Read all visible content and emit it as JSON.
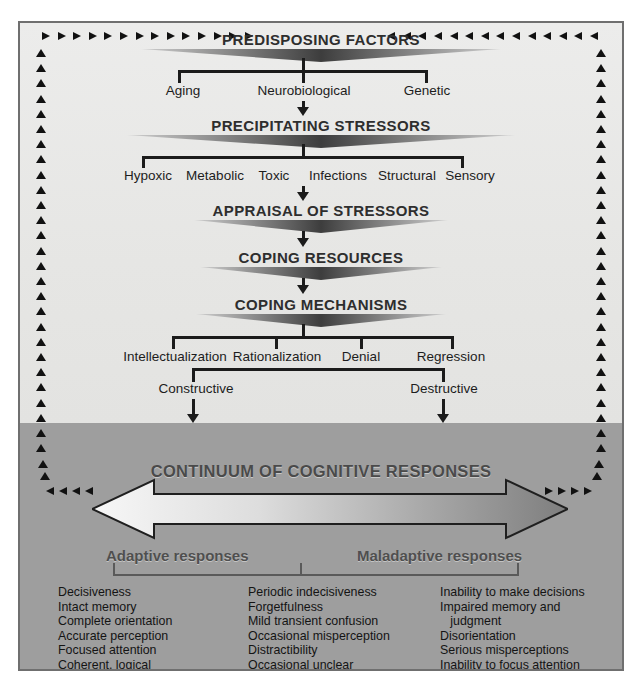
{
  "diagram": {
    "title": "Continuum of cognitive responses",
    "stages": [
      {
        "id": "predisposing",
        "label": "PREDISPOSING FACTORS"
      },
      {
        "id": "precipitating",
        "label": "PRECIPITATING STRESSORS"
      },
      {
        "id": "appraisal",
        "label": "APPRAISAL OF STRESSORS"
      },
      {
        "id": "coping-resources",
        "label": "COPING RESOURCES"
      },
      {
        "id": "coping-mechanisms",
        "label": "COPING MECHANISMS"
      }
    ],
    "predisposing_factors": [
      "Aging",
      "Neurobiological",
      "Genetic"
    ],
    "precipitating_stressors": [
      "Hypoxic",
      "Metabolic",
      "Toxic",
      "Infections",
      "Structural",
      "Sensory"
    ],
    "coping_mechanisms": [
      "Intellectualization",
      "Rationalization",
      "Denial",
      "Regression"
    ],
    "outcomes": [
      "Constructive",
      "Destructive"
    ],
    "continuum": {
      "title": "CONTINUUM OF COGNITIVE RESPONSES",
      "left_label": "Adaptive responses",
      "right_label": "Maladaptive responses"
    },
    "columns": [
      {
        "id": "adaptive",
        "items": [
          "Decisiveness",
          "Intact memory",
          "Complete orientation",
          "Accurate perception",
          "Focused attention",
          "Coherent, logical",
          "   thought"
        ]
      },
      {
        "id": "intermediate",
        "items": [
          "Periodic indecisiveness",
          "Forgetfulness",
          "Mild transient confusion",
          "Occasional misperception",
          "Distractibility",
          "Occasional unclear",
          "   thinking"
        ]
      },
      {
        "id": "maladaptive",
        "items": [
          "Inability to make decisions",
          "Impaired memory and",
          "   judgment",
          "Disorientation",
          "Serious misperceptions",
          "Inability to focus attention",
          "Difficulties with logical",
          "   reasoning"
        ]
      }
    ],
    "colors": {
      "frame": "#6f6f6f",
      "upper_bg": "#e8e8e6",
      "lower_bg": "#9e9e9e",
      "line": "#1b1b1b",
      "banner_dark": "#4b4b4b",
      "arrow_light": "#f2f2f2",
      "arrow_dark": "#8a8a8a"
    }
  }
}
